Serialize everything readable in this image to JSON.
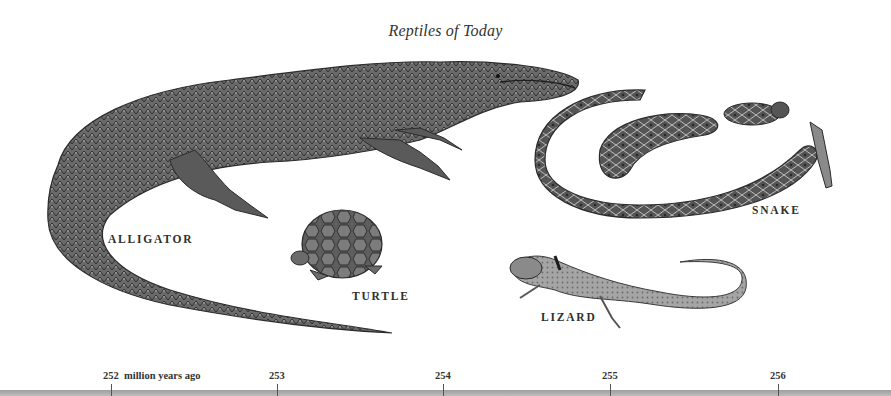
{
  "title": "Reptiles of Today",
  "animals": [
    {
      "name": "ALLIGATOR",
      "label_x": 108,
      "label_y": 233
    },
    {
      "name": "TURTLE",
      "label_x": 352,
      "label_y": 290
    },
    {
      "name": "SNAKE",
      "label_x": 752,
      "label_y": 204
    },
    {
      "name": "LIZARD",
      "label_x": 541,
      "label_y": 311
    }
  ],
  "timeline": {
    "unit_label": "million years ago",
    "ticks": [
      {
        "value": "252",
        "x": 111
      },
      {
        "value": "253",
        "x": 277
      },
      {
        "value": "254",
        "x": 443
      },
      {
        "value": "255",
        "x": 610
      },
      {
        "value": "256",
        "x": 778
      }
    ],
    "bar_color": "#b0b0b0"
  }
}
